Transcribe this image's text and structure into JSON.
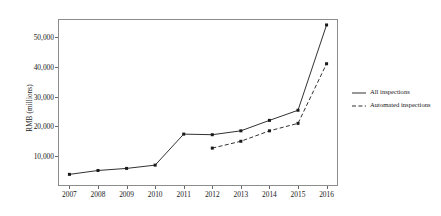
{
  "chart_data": {
    "type": "line",
    "title": "",
    "xlabel": "",
    "ylabel": "RMB (millions)",
    "categories": [
      "2007",
      "2008",
      "2009",
      "2010",
      "2011",
      "2012",
      "2013",
      "2014",
      "2015",
      "2016"
    ],
    "x": [
      2007,
      2008,
      2009,
      2010,
      2011,
      2012,
      2013,
      2014,
      2015,
      2016
    ],
    "ylim": [
      0,
      56000
    ],
    "xlim": [
      2006.6,
      2016.4
    ],
    "yticks": [
      10000,
      20000,
      30000,
      40000,
      50000
    ],
    "ytick_labels": [
      "10,000",
      "20,000",
      "30,000",
      "40,000",
      "50,000"
    ],
    "grid": false,
    "legend_position": "right",
    "series": [
      {
        "name": "All inspections",
        "style": "solid",
        "marker": "square",
        "color": "#1a1a1a",
        "values": [
          3900,
          5200,
          5900,
          7000,
          17400,
          17200,
          18500,
          22000,
          25400,
          54000
        ]
      },
      {
        "name": "Automated inspections",
        "style": "dashed",
        "marker": "square",
        "color": "#1a1a1a",
        "values": [
          null,
          null,
          null,
          null,
          null,
          12700,
          15000,
          18500,
          21000,
          41000
        ]
      }
    ]
  },
  "legend": {
    "items": [
      {
        "label": "All inspections",
        "style": "solid"
      },
      {
        "label": "Automated inspections",
        "style": "dashed"
      }
    ]
  }
}
